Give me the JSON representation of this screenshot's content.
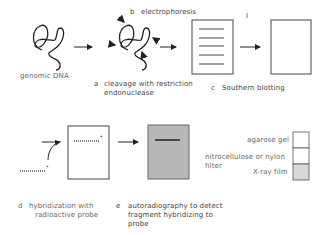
{
  "steps": {
    "genomic_dna": "genomic DNA",
    "a_letter": "a",
    "a_line1": "cleavage with restriction",
    "a_line2": "endonuclease",
    "b_letter": "b",
    "b_label": "electrophoresis",
    "c_letter": "c",
    "c_label": "Southern blotting",
    "d_letter": "d",
    "d_line1": "hybridization with",
    "d_line2": "radioactive probe",
    "e_letter": "e",
    "e_line1": "autoradiography to detect",
    "e_line2": "fragment hybridizing to",
    "e_line3": "probe",
    "mark": "I"
  },
  "legend": {
    "items": [
      {
        "label": "agarose gel",
        "color": "#ffffff"
      },
      {
        "label": "nitrocellulose or nylon",
        "label2": "filter",
        "color": "#ffffff"
      },
      {
        "label": "X-ray film",
        "color": "#d8d8d8"
      }
    ]
  },
  "colors": {
    "line": "#333333",
    "film": "#b8b8b8",
    "legend_film": "#d8d8d8"
  }
}
